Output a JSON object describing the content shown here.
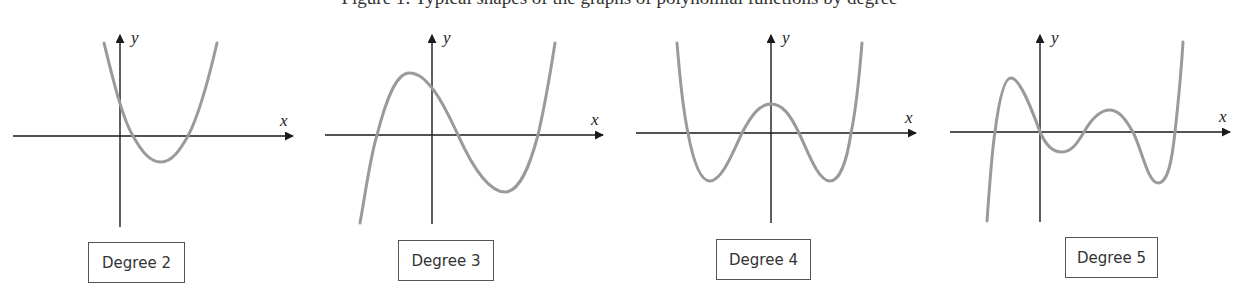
{
  "caption": {
    "text": "Figure 1: Typical shapes of the graphs of polynomial functions by degree",
    "visibility": "cut off at top edge, only descenders visible"
  },
  "colors": {
    "axis": "#1a1a1a",
    "curve": "#9a9a9a",
    "label_border": "#555555",
    "text": "#333333"
  },
  "panels": [
    {
      "label": "Degree 2",
      "x_axis_label": "x",
      "y_axis_label": "y",
      "shape": "parabola opening upward, vertex below x-axis, two real roots right of origin"
    },
    {
      "label": "Degree 3",
      "x_axis_label": "x",
      "y_axis_label": "y",
      "shape": "cubic with local max left of y-axis and local min right, three real roots"
    },
    {
      "label": "Degree 4",
      "x_axis_label": "x",
      "y_axis_label": "y",
      "shape": "symmetric W-shaped quartic, central max on y-axis, four real roots"
    },
    {
      "label": "Degree 5",
      "x_axis_label": "x",
      "y_axis_label": "y",
      "shape": "quintic with two local maxima and two local minima, five real roots (one at origin)"
    }
  ]
}
